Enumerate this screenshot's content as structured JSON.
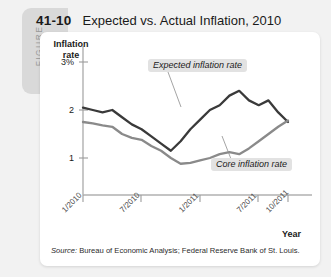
{
  "figure": {
    "tab_label": "FIGURE",
    "number": "41-10",
    "title": "Expected vs. Actual Inflation, 2010"
  },
  "source": {
    "prefix": "Source:",
    "text": " Bureau of Economic Analysis; Federal Reserve Bank of St. Louis."
  },
  "callouts": {
    "expected": "Expected inflation rate",
    "core": "Core inflation rate"
  },
  "colors": {
    "expected_line": "#3a3a3a",
    "core_line": "#8a8a8a",
    "tab": "#d9d9d9",
    "callout_bg": "#e2e2e2",
    "axis": "#b0b0b0"
  },
  "chart_data": {
    "type": "line",
    "title": "Expected vs. Actual Inflation, 2010",
    "xlabel": "Year",
    "ylabel": "Inflation rate",
    "ylim": [
      0,
      3.2
    ],
    "ytick_labels": [
      "3%",
      "2",
      "1"
    ],
    "ytick_values": [
      3,
      2,
      1
    ],
    "grid": false,
    "legend": "annotations",
    "xtick_labels": [
      "1/2010",
      "7/2010",
      "1/2011",
      "7/2011",
      "10/2011"
    ],
    "xtick_values": [
      0,
      6,
      12,
      18,
      21
    ],
    "x": [
      0,
      1,
      2,
      3,
      4,
      5,
      6,
      7,
      8,
      9,
      10,
      11,
      12,
      13,
      14,
      15,
      16,
      17,
      18,
      19,
      20,
      21
    ],
    "series": [
      {
        "name": "Expected inflation rate",
        "color": "#3a3a3a",
        "values": [
          2.05,
          2.0,
          1.95,
          2.0,
          1.85,
          1.7,
          1.6,
          1.45,
          1.3,
          1.15,
          1.35,
          1.6,
          1.8,
          2.0,
          2.1,
          2.3,
          2.4,
          2.2,
          2.1,
          2.2,
          1.95,
          1.75
        ]
      },
      {
        "name": "Core inflation rate",
        "color": "#8a8a8a",
        "values": [
          1.75,
          1.72,
          1.68,
          1.65,
          1.5,
          1.42,
          1.38,
          1.25,
          1.15,
          1.0,
          0.88,
          0.9,
          0.95,
          1.0,
          1.08,
          1.12,
          1.08,
          1.2,
          1.35,
          1.5,
          1.65,
          1.78
        ]
      }
    ]
  }
}
